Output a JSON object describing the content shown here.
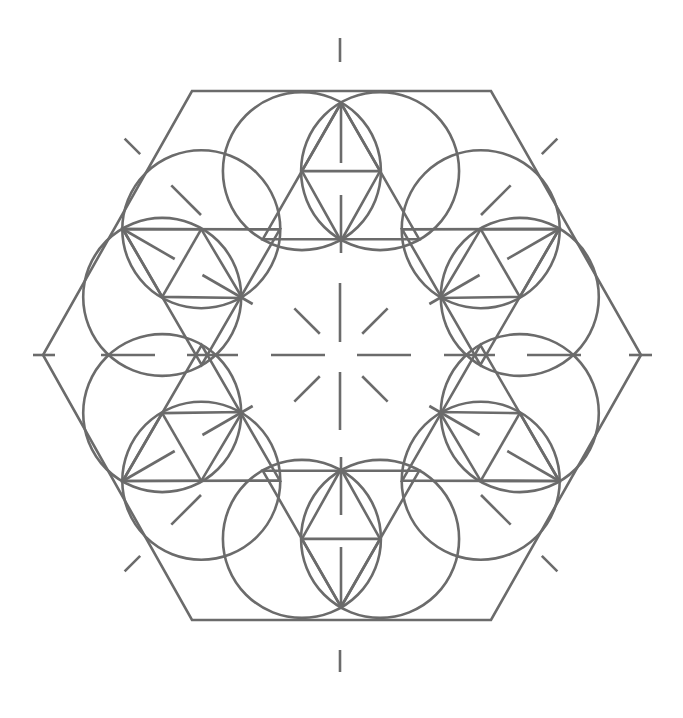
{
  "diagram": {
    "title": "",
    "stroke_color": "#6b6b6b",
    "background": "#ffffff",
    "stroke_width": 2.6,
    "center": [
      341,
      355
    ],
    "hexagon": {
      "vertices": [
        [
          192,
          91
        ],
        [
          491,
          91
        ],
        [
          641,
          355
        ],
        [
          491,
          620
        ],
        [
          192,
          620
        ],
        [
          43,
          355
        ]
      ]
    },
    "units": {
      "count": 6,
      "angles_deg": [
        90,
        30,
        -30,
        -90,
        -150,
        150
      ],
      "outer_tip_radius": 252,
      "inner_tip_radius": 114,
      "side_vertex_radius": 188,
      "side_vertex_angle_offset_deg": 12,
      "circle_radius": 79,
      "radial_dash_segments": [
        [
          252,
          192
        ],
        [
          160,
          102
        ]
      ]
    },
    "axes": {
      "horizontal_dashes": [
        [
          33,
          55
        ],
        [
          101,
          155
        ],
        [
          187,
          238
        ],
        [
          271,
          325
        ],
        [
          357,
          411
        ],
        [
          444,
          495
        ],
        [
          527,
          581
        ],
        [
          629,
          652
        ]
      ],
      "vertical_dashes": [
        [
          38,
          62
        ],
        [
          283,
          342
        ],
        [
          372,
          430
        ],
        [
          650,
          672
        ]
      ],
      "diagonal_dash_radii": [
        [
          30,
          66
        ],
        [
          198,
          240
        ],
        [
          284,
          306
        ]
      ],
      "diagonal_angles_deg": [
        45,
        135,
        225,
        315
      ]
    }
  }
}
